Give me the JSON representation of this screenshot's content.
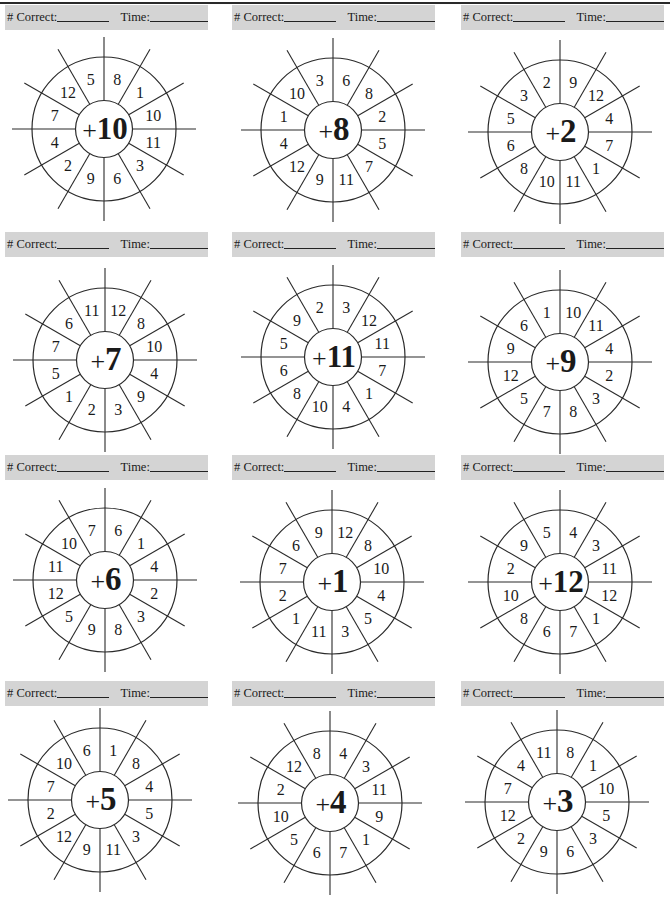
{
  "worksheet": {
    "header": {
      "correct_label": "# Correct:",
      "time_label": "Time:"
    },
    "wheel_order_note": "numbers listed clockwise starting from the wedge just right of the top spoke",
    "wheels": [
      {
        "addend": "+10",
        "numbers": [
          "8",
          "1",
          "10",
          "11",
          "3",
          "6",
          "9",
          "2",
          "4",
          "7",
          "12",
          "5"
        ]
      },
      {
        "addend": "+8",
        "numbers": [
          "6",
          "8",
          "2",
          "5",
          "7",
          "11",
          "9",
          "12",
          "4",
          "1",
          "10",
          "3"
        ]
      },
      {
        "addend": "+2",
        "numbers": [
          "9",
          "12",
          "4",
          "7",
          "1",
          "11",
          "10",
          "8",
          "6",
          "5",
          "3",
          "2"
        ]
      },
      {
        "addend": "+7",
        "numbers": [
          "12",
          "8",
          "10",
          "4",
          "9",
          "3",
          "2",
          "1",
          "5",
          "7",
          "6",
          "11"
        ]
      },
      {
        "addend": "+11",
        "numbers": [
          "3",
          "12",
          "11",
          "7",
          "1",
          "4",
          "10",
          "8",
          "6",
          "5",
          "9",
          "2"
        ]
      },
      {
        "addend": "+9",
        "numbers": [
          "10",
          "11",
          "4",
          "2",
          "3",
          "8",
          "7",
          "5",
          "12",
          "9",
          "6",
          "1"
        ]
      },
      {
        "addend": "+6",
        "numbers": [
          "6",
          "1",
          "4",
          "2",
          "3",
          "8",
          "9",
          "5",
          "12",
          "11",
          "10",
          "7"
        ]
      },
      {
        "addend": "+1",
        "numbers": [
          "12",
          "8",
          "10",
          "4",
          "5",
          "3",
          "11",
          "1",
          "2",
          "7",
          "6",
          "9"
        ]
      },
      {
        "addend": "+12",
        "numbers": [
          "4",
          "3",
          "11",
          "12",
          "1",
          "7",
          "6",
          "8",
          "10",
          "2",
          "9",
          "5"
        ]
      },
      {
        "addend": "+5",
        "numbers": [
          "1",
          "8",
          "4",
          "5",
          "3",
          "11",
          "9",
          "12",
          "2",
          "7",
          "10",
          "6"
        ]
      },
      {
        "addend": "+4",
        "numbers": [
          "4",
          "3",
          "11",
          "9",
          "1",
          "7",
          "6",
          "5",
          "10",
          "2",
          "12",
          "8"
        ]
      },
      {
        "addend": "+3",
        "numbers": [
          "8",
          "1",
          "10",
          "5",
          "3",
          "6",
          "9",
          "2",
          "12",
          "7",
          "4",
          "11"
        ]
      }
    ]
  }
}
